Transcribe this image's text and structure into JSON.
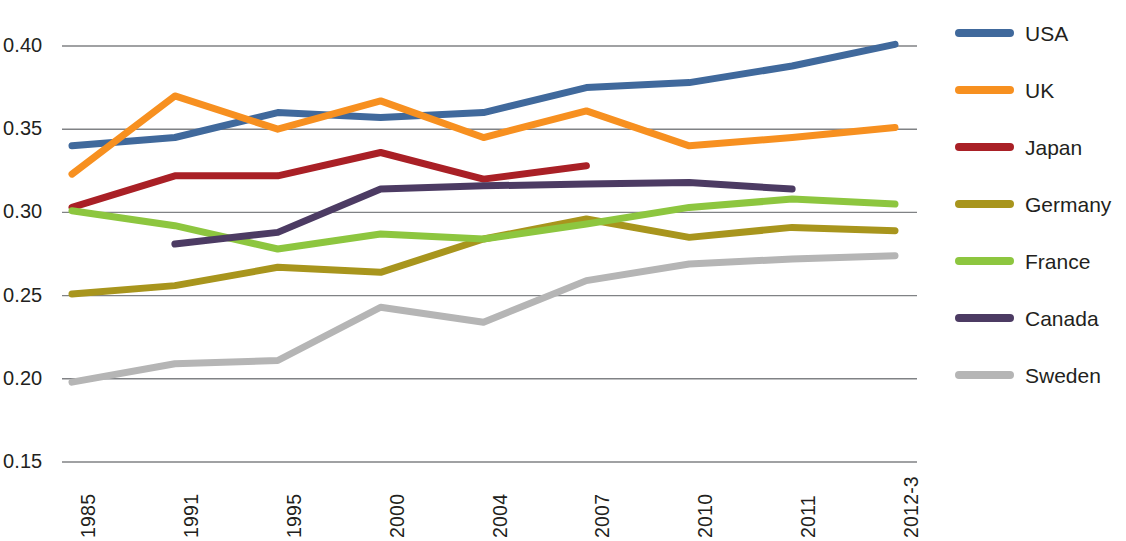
{
  "chart_data": {
    "type": "line",
    "title": "",
    "subtitle": "",
    "xlabel": "",
    "ylabel": "",
    "categories": [
      "1985",
      "1991",
      "1995",
      "2000",
      "2004",
      "2007",
      "2010",
      "2011",
      "2012-3"
    ],
    "ylim": [
      0.15,
      0.4
    ],
    "yticks": [
      "0.15",
      "0.20",
      "0.25",
      "0.30",
      "0.35",
      "0.40"
    ],
    "ytick_values": [
      0.15,
      0.2,
      0.25,
      0.3,
      0.35,
      0.4
    ],
    "grid": true,
    "legend_position": "right",
    "series": [
      {
        "name": "USA",
        "color": "#40699c",
        "x": [
          "1985",
          "1991",
          "1995",
          "2000",
          "2004",
          "2007",
          "2010",
          "2011",
          "2012-3"
        ],
        "values": [
          0.34,
          0.345,
          0.36,
          0.357,
          0.36,
          0.375,
          0.378,
          0.388,
          0.401
        ]
      },
      {
        "name": "UK",
        "color": "#f79020",
        "x": [
          "1985",
          "1991",
          "1995",
          "2000",
          "2004",
          "2007",
          "2010",
          "2011",
          "2012-3"
        ],
        "values": [
          0.323,
          0.37,
          0.35,
          0.367,
          0.345,
          0.361,
          0.34,
          0.345,
          0.351
        ]
      },
      {
        "name": "Japan",
        "color": "#a92026",
        "x": [
          "1985",
          "1991",
          "1995",
          "2000",
          "2004",
          "2007"
        ],
        "values": [
          0.303,
          0.322,
          0.322,
          0.336,
          0.32,
          0.328
        ]
      },
      {
        "name": "Germany",
        "color": "#a8951d",
        "x": [
          "1985",
          "1991",
          "1995",
          "2000",
          "2004",
          "2007",
          "2010",
          "2011",
          "2012-3"
        ],
        "values": [
          0.251,
          0.256,
          0.267,
          0.264,
          0.284,
          0.296,
          0.285,
          0.291,
          0.289
        ]
      },
      {
        "name": "France",
        "color": "#8dc63f",
        "x": [
          "1985",
          "1991",
          "1995",
          "2000",
          "2004",
          "2007",
          "2010",
          "2011",
          "2012-3"
        ],
        "values": [
          0.301,
          0.292,
          0.278,
          0.287,
          0.284,
          0.293,
          0.303,
          0.308,
          0.305
        ]
      },
      {
        "name": "Canada",
        "color": "#4c3b63",
        "x": [
          "1991",
          "1995",
          "2000",
          "2004",
          "2007",
          "2010",
          "2011"
        ],
        "values": [
          0.281,
          0.288,
          0.314,
          0.316,
          0.317,
          0.318,
          0.314
        ]
      },
      {
        "name": "Sweden",
        "color": "#b5b5b5",
        "x": [
          "1985",
          "1991",
          "1995",
          "2000",
          "2004",
          "2007",
          "2010",
          "2011",
          "2012-3"
        ],
        "values": [
          0.198,
          0.209,
          0.211,
          0.243,
          0.234,
          0.259,
          0.269,
          0.272,
          0.274
        ]
      }
    ]
  },
  "legend": {
    "items": [
      {
        "label": "USA"
      },
      {
        "label": "UK"
      },
      {
        "label": "Japan"
      },
      {
        "label": "Germany"
      },
      {
        "label": "France"
      },
      {
        "label": "Canada"
      },
      {
        "label": "Sweden"
      }
    ]
  }
}
